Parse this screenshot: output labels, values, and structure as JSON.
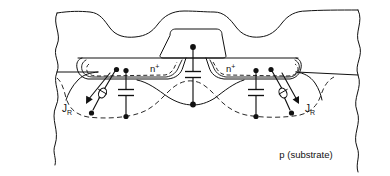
{
  "figure": {
    "type": "semiconductor-device-cross-section",
    "width": 390,
    "height": 176,
    "background_color": "#ffffff",
    "line_color": "#111111"
  },
  "labels": {
    "nplus_left": {
      "base": "n",
      "sup": "+"
    },
    "nplus_right": {
      "base": "n",
      "sup": "+"
    },
    "jr_left": {
      "base": "J",
      "sub": "R"
    },
    "jr_right": {
      "base": "J",
      "sub": "R"
    },
    "substrate": "p (substrate)"
  },
  "regions": [
    {
      "name": "field-oxide-left",
      "kind": "locos-oxide"
    },
    {
      "name": "field-oxide-right",
      "kind": "locos-oxide"
    },
    {
      "name": "gate-electrode",
      "kind": "gate-stack"
    },
    {
      "name": "source-diffusion",
      "kind": "n-plus-diffusion"
    },
    {
      "name": "drain-diffusion",
      "kind": "n-plus-diffusion"
    },
    {
      "name": "substrate-body",
      "kind": "p-substrate"
    },
    {
      "name": "depletion-boundary",
      "kind": "dashed-depletion-edge"
    }
  ],
  "symbols": [
    {
      "name": "diode-left",
      "kind": "leakage-diode",
      "label": "J_R"
    },
    {
      "name": "capacitor-left",
      "kind": "junction-capacitance"
    },
    {
      "name": "capacitor-center",
      "kind": "gate-capacitance"
    },
    {
      "name": "capacitor-right",
      "kind": "junction-capacitance"
    },
    {
      "name": "diode-right",
      "kind": "leakage-diode",
      "label": "J_R"
    }
  ]
}
